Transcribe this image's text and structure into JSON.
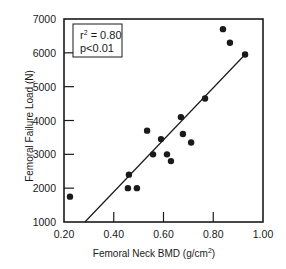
{
  "chart_data": {
    "type": "scatter",
    "title": "",
    "xlabel": "Femoral Neck BMD (g/cm",
    "xlabel_sup": "2",
    "xlabel_suffix": ")",
    "ylabel": "Femoral Failure Load (N)",
    "xlim": [
      0.2,
      1.0
    ],
    "ylim": [
      1000,
      7000
    ],
    "x_ticks": [
      0.2,
      0.4,
      0.6,
      0.8,
      1.0
    ],
    "x_tick_labels": [
      "0.20",
      "0.40",
      "0.60",
      "0.80",
      "1.00"
    ],
    "y_ticks": [
      1000,
      2000,
      3000,
      4000,
      5000,
      6000,
      7000
    ],
    "y_tick_labels": [
      "1000",
      "2000",
      "3000",
      "4000",
      "5000",
      "6000",
      "7000"
    ],
    "grid": false,
    "legend": null,
    "points": [
      {
        "x": 0.224,
        "y": 1750
      },
      {
        "x": 0.457,
        "y": 2000
      },
      {
        "x": 0.493,
        "y": 2000
      },
      {
        "x": 0.461,
        "y": 2400
      },
      {
        "x": 0.534,
        "y": 3700
      },
      {
        "x": 0.558,
        "y": 3000
      },
      {
        "x": 0.59,
        "y": 3450
      },
      {
        "x": 0.614,
        "y": 3000
      },
      {
        "x": 0.63,
        "y": 2800
      },
      {
        "x": 0.67,
        "y": 4100
      },
      {
        "x": 0.678,
        "y": 3600
      },
      {
        "x": 0.711,
        "y": 3350
      },
      {
        "x": 0.767,
        "y": 4650
      },
      {
        "x": 0.839,
        "y": 6700
      },
      {
        "x": 0.867,
        "y": 6300
      },
      {
        "x": 0.928,
        "y": 5950
      }
    ],
    "regression_line": {
      "start": {
        "x": 0.284,
        "y": 1000
      },
      "end": {
        "x": 0.928,
        "y": 5950
      }
    },
    "annotation": {
      "r2_prefix": "r",
      "r2_sup": "2",
      "r2_value": " = 0.80",
      "p_value": "p<0.01",
      "placement": "top-left"
    },
    "colors": {
      "ink": "#1a1a1a",
      "background": "#ffffff"
    }
  }
}
